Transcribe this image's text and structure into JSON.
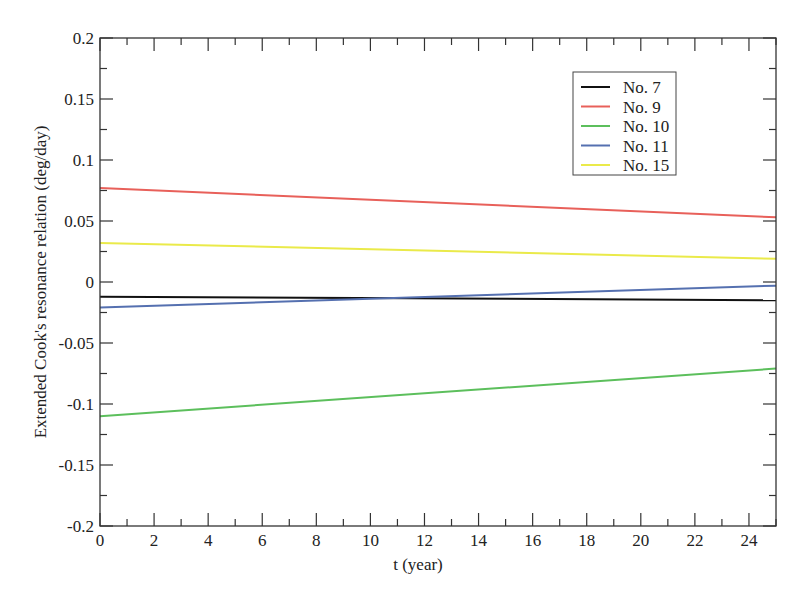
{
  "chart_data": {
    "type": "line",
    "title": "",
    "xlabel": "t (year)",
    "ylabel": "Extended Cook's resonance relation (deg/day)",
    "xlim": [
      0,
      25
    ],
    "ylim": [
      -0.2,
      0.2
    ],
    "x_ticks": [
      0,
      2,
      4,
      6,
      8,
      10,
      12,
      14,
      16,
      18,
      20,
      22,
      24
    ],
    "x_tick_labels": [
      "0",
      "2",
      "4",
      "6",
      "8",
      "10",
      "12",
      "14",
      "16",
      "18",
      "20",
      "22",
      "24"
    ],
    "y_ticks": [
      0.2,
      0.15,
      0.1,
      0.05,
      0,
      -0.05,
      -0.1,
      -0.15,
      -0.2
    ],
    "y_tick_labels": [
      "0.2",
      "0.15",
      "0.1",
      "0.05",
      "0",
      "-0.05",
      "-0.1",
      "-0.15",
      "-0.2"
    ],
    "grid": false,
    "legend_position": "upper right (inside)",
    "series": [
      {
        "name": "No. 7",
        "color": "#111111",
        "x": [
          0,
          25
        ],
        "values": [
          -0.012,
          -0.015
        ]
      },
      {
        "name": "No. 9",
        "color": "#e8605a",
        "x": [
          0,
          25
        ],
        "values": [
          0.077,
          0.053
        ]
      },
      {
        "name": "No. 10",
        "color": "#5cbf5c",
        "x": [
          0,
          25
        ],
        "values": [
          -0.11,
          -0.071
        ]
      },
      {
        "name": "No. 11",
        "color": "#5570b0",
        "x": [
          0,
          25
        ],
        "values": [
          -0.021,
          -0.003
        ]
      },
      {
        "name": "No. 15",
        "color": "#eaea4a",
        "x": [
          0,
          25
        ],
        "values": [
          0.032,
          0.019
        ]
      }
    ]
  }
}
